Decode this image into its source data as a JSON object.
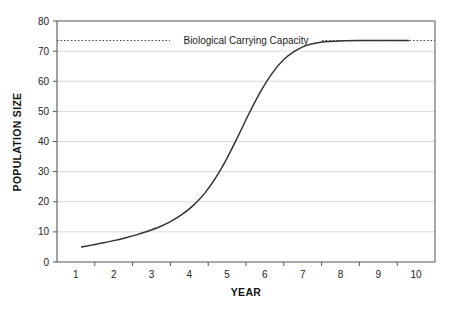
{
  "chart_data": {
    "type": "line",
    "title": "",
    "xlabel": "YEAR",
    "ylabel": "POPULATION SIZE",
    "xlim": [
      0.5,
      10.5
    ],
    "ylim": [
      0,
      80
    ],
    "grid": true,
    "legend_position": "none",
    "x_tick_labels": [
      "1",
      "2",
      "3",
      "4",
      "5",
      "6",
      "7",
      "8",
      "9",
      "10"
    ],
    "y_tick_labels": [
      "0",
      "10",
      "20",
      "30",
      "40",
      "50",
      "60",
      "70",
      "80"
    ],
    "y_ticks": [
      0,
      10,
      20,
      30,
      40,
      50,
      60,
      70,
      80
    ],
    "annotations": [
      {
        "text": "Biological Carrying Capacity",
        "value": 73.5,
        "style": "dotted-horizontal-line"
      }
    ],
    "series": [
      {
        "name": "Population",
        "x": [
          1.15,
          1.4,
          1.7,
          2.0,
          2.3,
          2.6,
          2.9,
          3.2,
          3.5,
          3.8,
          4.1,
          4.4,
          4.7,
          5.0,
          5.3,
          5.6,
          5.9,
          6.2,
          6.5,
          6.8,
          7.1,
          7.4,
          7.7,
          8.0,
          8.5,
          9.0,
          9.4,
          9.8
        ],
        "values": [
          5.0,
          5.6,
          6.3,
          7.1,
          8.0,
          9.0,
          10.2,
          11.6,
          13.4,
          15.7,
          18.7,
          22.7,
          28.0,
          34.5,
          42.0,
          49.8,
          56.9,
          62.8,
          67.2,
          70.1,
          71.9,
          72.8,
          73.2,
          73.4,
          73.5,
          73.5,
          73.5,
          73.5
        ]
      }
    ],
    "colors": {
      "curve": "#333333",
      "grid": "#d9d9d9",
      "axis": "#555555",
      "text": "#1b1b1b",
      "capacity_line": "#444444",
      "background": "#ffffff"
    }
  }
}
